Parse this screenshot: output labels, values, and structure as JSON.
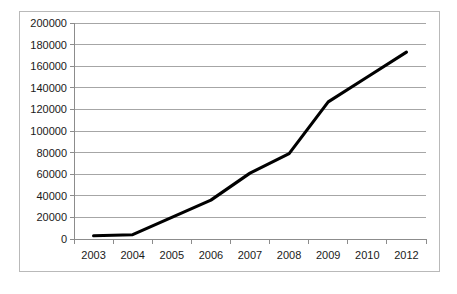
{
  "chart_data": {
    "type": "line",
    "title": "",
    "subtitle": "",
    "xlabel": "",
    "ylabel": "",
    "categories": [
      "2003",
      "2004",
      "2005",
      "2006",
      "2007",
      "2008",
      "2009",
      "2010",
      "2012"
    ],
    "series": [
      {
        "name": "",
        "values": [
          3000,
          4000,
          20000,
          36000,
          61000,
          79000,
          127000,
          150000,
          173000
        ]
      }
    ],
    "ylim": [
      0,
      200000
    ],
    "ytick_values": [
      0,
      20000,
      40000,
      60000,
      80000,
      100000,
      120000,
      140000,
      160000,
      180000,
      200000
    ],
    "ytick_labels": [
      "0",
      "20000",
      "40000",
      "60000",
      "80000",
      "100000",
      "120000",
      "140000",
      "160000",
      "180000",
      "200000"
    ],
    "xtick_labels": [
      "2003",
      "2004",
      "2005",
      "2006",
      "2007",
      "2008",
      "2009",
      "2010",
      "2012"
    ],
    "grid": true,
    "grid_axis": "y",
    "legend": false,
    "legend_position": "none",
    "markers": false,
    "annotations": [],
    "colors": {
      "series_line": "#000000",
      "gridline": "#a6a6a6",
      "axis": "#8c8c8c",
      "frame_border": "#b9b9b9",
      "plot_background": "#ffffff",
      "tick_text": "#1a1a1a"
    }
  },
  "layout": {
    "plot_left": 54,
    "plot_right": 406,
    "plot_top": 11,
    "plot_bottom": 227,
    "figure_width": 421,
    "figure_height": 261
  }
}
